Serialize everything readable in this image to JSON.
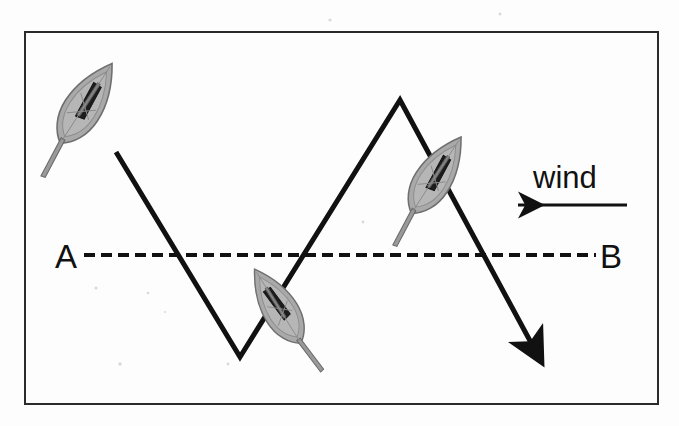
{
  "figure": {
    "kind": "sailing-tacking-diagram",
    "background_color": "#fdfdfd",
    "ink_color": "#111111",
    "border": {
      "name": "figure-border",
      "color": "#2b2b2b",
      "width": 2,
      "x": 25,
      "y": 32,
      "w": 633,
      "h": 372
    }
  },
  "labels": {
    "point_a": "A",
    "point_b": "B",
    "wind": "wind"
  },
  "baseline": {
    "name": "course-baseline-ab",
    "style": "dashed",
    "color": "#111111",
    "y": 255,
    "x_start": 84,
    "x_end": 596,
    "dash_length": 11,
    "gap_length": 6,
    "stroke_width": 4
  },
  "wind_arrow": {
    "name": "wind-direction-arrow",
    "direction": "right-to-left",
    "color": "#111111",
    "x_tail": 627,
    "x_head": 514,
    "y": 205,
    "stroke_width": 3
  },
  "course": {
    "name": "tacking-course-path",
    "color": "#111111",
    "stroke_width": 5,
    "has_end_arrow": true,
    "points": [
      {
        "x": 116,
        "y": 152,
        "note": "start leg from first boat"
      },
      {
        "x": 240,
        "y": 357,
        "note": "first tack point, below baseline"
      },
      {
        "x": 400,
        "y": 100,
        "note": "second tack point, above baseline"
      },
      {
        "x": 535,
        "y": 350,
        "note": "arrow head, end of course"
      }
    ]
  },
  "boats": [
    {
      "name": "sailboat-1",
      "position": "upper-left",
      "cx": 87,
      "cy": 102,
      "rotation_deg": 33,
      "scale": 1.0,
      "hull_color": "#a9a9a9",
      "sail_color": "#1c1c1c",
      "heading": "down-right on port tack"
    },
    {
      "name": "sailboat-2",
      "position": "middle-baseline",
      "cx": 277,
      "cy": 305,
      "rotation_deg": -32,
      "scale": 0.92,
      "hull_color": "#a9a9a9",
      "sail_color": "#1c1c1c",
      "heading": "up-right after tacking"
    },
    {
      "name": "sailboat-3",
      "position": "upper-right",
      "cx": 437,
      "cy": 174,
      "rotation_deg": 33,
      "scale": 0.96,
      "hull_color": "#a9a9a9",
      "sail_color": "#1c1c1c",
      "heading": "down-right on port tack"
    }
  ]
}
